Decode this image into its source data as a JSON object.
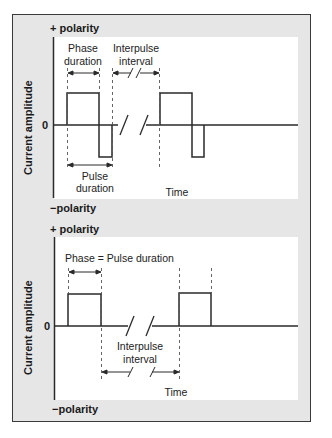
{
  "figure": {
    "top": {
      "plus_polarity": "+ polarity",
      "minus_polarity": "−polarity",
      "y_axis_label": "Current amplitude",
      "zero_label": "0",
      "phase_label_1": "Phase",
      "phase_label_2": "duration",
      "interpulse_label_1": "Interpulse",
      "interpulse_label_2": "interval",
      "pulse_label_1": "Pulse",
      "pulse_label_2": "duration",
      "x_axis_label": "Time"
    },
    "bottom": {
      "plus_polarity": "+ polarity",
      "minus_polarity": "−polarity",
      "y_axis_label": "Current amplitude",
      "zero_label": "0",
      "phase_label": "Phase = Pulse duration",
      "interpulse_label_1": "Interpulse",
      "interpulse_label_2": "interval",
      "x_axis_label": "Time"
    }
  },
  "colors": {
    "frame_bg": "#e6e6e6",
    "panel_bg": "#ffffff",
    "line": "#2a2a2a",
    "dash": "#555555"
  }
}
